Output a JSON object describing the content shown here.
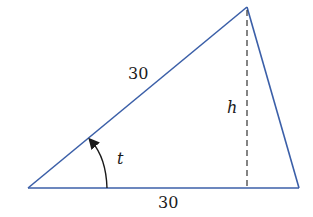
{
  "diagram": {
    "type": "triangle",
    "colors": {
      "sides": "#3b5fa8",
      "height_line": "#333333",
      "arc": "#1a1a1a",
      "text": "#1a1a1a"
    },
    "vertices": {
      "bottom_left": [
        28,
        188
      ],
      "top": [
        247,
        7
      ],
      "bottom_right": [
        299,
        188
      ]
    },
    "labels": {
      "hypotenuse_side": "30",
      "base_side": "30",
      "height": "h",
      "angle": "t"
    }
  }
}
